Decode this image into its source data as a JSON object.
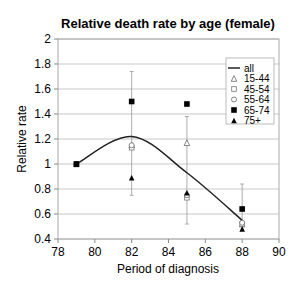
{
  "chart_data": {
    "type": "scatter",
    "title": "Relative death rate by age (female)",
    "xlabel": "Period of diagnosis",
    "ylabel": "Relative rate",
    "xlim": [
      78,
      90
    ],
    "ylim": [
      0.4,
      2
    ],
    "x_ticks": [
      78,
      80,
      82,
      84,
      86,
      88,
      90
    ],
    "y_ticks": [
      0.4,
      0.6,
      0.8,
      1,
      1.2,
      1.4,
      1.6,
      1.8,
      2
    ],
    "y_tick_labels": [
      "0.4",
      "0.6",
      "0.8",
      "1",
      "1.2",
      "1.4",
      "1.6",
      "1.8",
      "2"
    ],
    "grid": "horizontal",
    "legend_position": "upper right",
    "line": {
      "name": "all",
      "x": [
        79,
        82,
        85,
        88
      ],
      "y": [
        1.0,
        1.22,
        0.93,
        0.55
      ],
      "smoothed": true
    },
    "series": [
      {
        "name": "15-44",
        "marker": "open-triangle",
        "x": [
          79,
          82,
          85,
          88
        ],
        "y": [
          1.0,
          1.15,
          1.17,
          0.52
        ]
      },
      {
        "name": "45-54",
        "marker": "open-square",
        "x": [
          79,
          82,
          85,
          88
        ],
        "y": [
          1.0,
          1.13,
          0.73,
          0.52
        ]
      },
      {
        "name": "55-64",
        "marker": "open-diamond",
        "x": [
          79,
          82,
          85,
          88
        ],
        "y": [
          1.0,
          1.15,
          0.75,
          0.53
        ]
      },
      {
        "name": "65-74",
        "marker": "filled-square",
        "x": [
          79,
          82,
          85,
          88
        ],
        "y": [
          1.0,
          1.5,
          1.48,
          0.64
        ]
      },
      {
        "name": "75+",
        "marker": "filled-triangle",
        "x": [
          79,
          82,
          85,
          88
        ],
        "y": [
          1.0,
          0.89,
          0.77,
          0.48
        ]
      }
    ],
    "error_bars": [
      {
        "x": 82,
        "low": 0.75,
        "high": 1.74
      },
      {
        "x": 85,
        "low": 0.52,
        "high": 1.38
      },
      {
        "x": 88,
        "low": 0.47,
        "high": 0.84
      }
    ]
  },
  "legend": [
    "all",
    "15-44",
    "45-54",
    "55-64",
    "65-74",
    "75+"
  ]
}
